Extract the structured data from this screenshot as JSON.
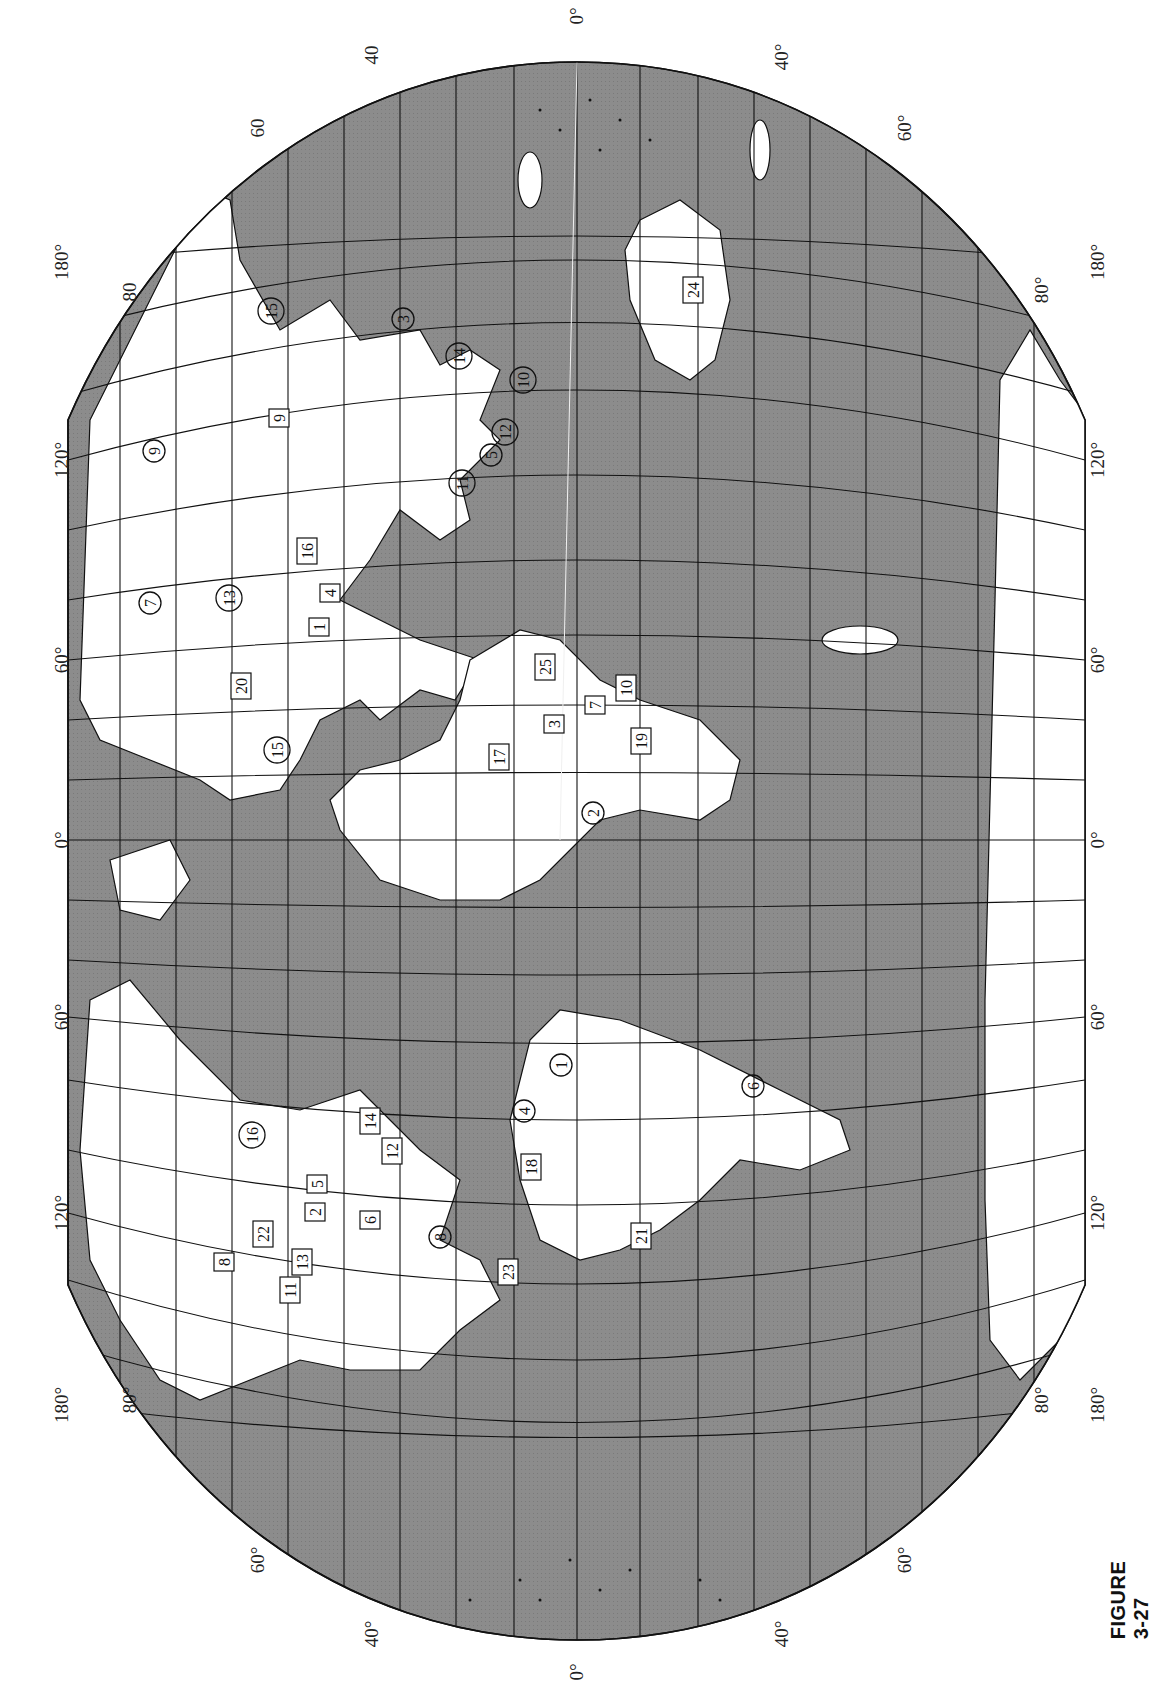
{
  "figure": {
    "caption": "FIGURE 3-27"
  },
  "colors": {
    "ocean": "#8c8c8c",
    "land": "#ffffff",
    "grid": "#111111",
    "border": "#111111"
  },
  "labels": {
    "top": [
      {
        "text": "80",
        "x": 130,
        "y": 292
      },
      {
        "text": "60",
        "x": 258,
        "y": 128
      },
      {
        "text": "40",
        "x": 372,
        "y": 55
      },
      {
        "text": "0°",
        "x": 577,
        "y": 16
      },
      {
        "text": "40°",
        "x": 782,
        "y": 57
      },
      {
        "text": "60°",
        "x": 905,
        "y": 128
      },
      {
        "text": "80°",
        "x": 1042,
        "y": 290
      }
    ],
    "bottom": [
      {
        "text": "80°",
        "x": 130,
        "y": 1400
      },
      {
        "text": "60°",
        "x": 258,
        "y": 1560
      },
      {
        "text": "40°",
        "x": 372,
        "y": 1634
      },
      {
        "text": "0°",
        "x": 577,
        "y": 1672
      },
      {
        "text": "40°",
        "x": 782,
        "y": 1634
      },
      {
        "text": "60°",
        "x": 905,
        "y": 1560
      },
      {
        "text": "80°",
        "x": 1042,
        "y": 1400
      }
    ],
    "left": [
      {
        "text": "180°",
        "x": 62,
        "y": 262
      },
      {
        "text": "120°",
        "x": 62,
        "y": 460
      },
      {
        "text": "60°",
        "x": 62,
        "y": 660
      },
      {
        "text": "0°",
        "x": 62,
        "y": 840
      },
      {
        "text": "60°",
        "x": 62,
        "y": 1017
      },
      {
        "text": "120°",
        "x": 62,
        "y": 1213
      },
      {
        "text": "180°",
        "x": 62,
        "y": 1405
      }
    ],
    "right": [
      {
        "text": "180°",
        "x": 1098,
        "y": 262
      },
      {
        "text": "120°",
        "x": 1098,
        "y": 460
      },
      {
        "text": "60°",
        "x": 1098,
        "y": 660
      },
      {
        "text": "0°",
        "x": 1098,
        "y": 840
      },
      {
        "text": "60°",
        "x": 1098,
        "y": 1017
      },
      {
        "text": "120°",
        "x": 1098,
        "y": 1213
      },
      {
        "text": "180°",
        "x": 1098,
        "y": 1405
      }
    ]
  },
  "sites": {
    "boxed": [
      {
        "n": "24",
        "x": 693,
        "y": 290
      },
      {
        "n": "9",
        "x": 279,
        "y": 418
      },
      {
        "n": "16",
        "x": 307,
        "y": 551
      },
      {
        "n": "4",
        "x": 330,
        "y": 593
      },
      {
        "n": "1",
        "x": 319,
        "y": 627
      },
      {
        "n": "20",
        "x": 241,
        "y": 686
      },
      {
        "n": "17",
        "x": 499,
        "y": 757
      },
      {
        "n": "25",
        "x": 545,
        "y": 667
      },
      {
        "n": "7",
        "x": 595,
        "y": 705
      },
      {
        "n": "10",
        "x": 626,
        "y": 688
      },
      {
        "n": "3",
        "x": 554,
        "y": 724
      },
      {
        "n": "19",
        "x": 641,
        "y": 741
      },
      {
        "n": "14",
        "x": 370,
        "y": 1121
      },
      {
        "n": "12",
        "x": 392,
        "y": 1151
      },
      {
        "n": "5",
        "x": 317,
        "y": 1184
      },
      {
        "n": "2",
        "x": 315,
        "y": 1212
      },
      {
        "n": "6",
        "x": 370,
        "y": 1220
      },
      {
        "n": "22",
        "x": 263,
        "y": 1234
      },
      {
        "n": "8",
        "x": 224,
        "y": 1262
      },
      {
        "n": "13",
        "x": 302,
        "y": 1262
      },
      {
        "n": "11",
        "x": 290,
        "y": 1290
      },
      {
        "n": "18",
        "x": 531,
        "y": 1167
      },
      {
        "n": "23",
        "x": 508,
        "y": 1272
      },
      {
        "n": "21",
        "x": 641,
        "y": 1236
      }
    ],
    "circled": [
      {
        "n": "15",
        "x": 271,
        "y": 311
      },
      {
        "n": "3",
        "x": 403,
        "y": 319
      },
      {
        "n": "14",
        "x": 459,
        "y": 356
      },
      {
        "n": "10",
        "x": 523,
        "y": 380
      },
      {
        "n": "9",
        "x": 154,
        "y": 451
      },
      {
        "n": "12",
        "x": 505,
        "y": 432
      },
      {
        "n": "5",
        "x": 491,
        "y": 455
      },
      {
        "n": "11",
        "x": 462,
        "y": 483
      },
      {
        "n": "7",
        "x": 150,
        "y": 603
      },
      {
        "n": "13",
        "x": 229,
        "y": 598
      },
      {
        "n": "15",
        "x": 277,
        "y": 750
      },
      {
        "n": "2",
        "x": 593,
        "y": 813
      },
      {
        "n": "1",
        "x": 561,
        "y": 1065
      },
      {
        "n": "4",
        "x": 524,
        "y": 1111
      },
      {
        "n": "6",
        "x": 753,
        "y": 1086
      },
      {
        "n": "16",
        "x": 252,
        "y": 1135
      },
      {
        "n": "8",
        "x": 440,
        "y": 1237
      }
    ]
  }
}
